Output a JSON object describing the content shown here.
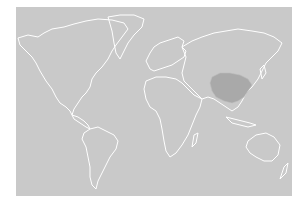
{
  "map": {
    "type": "world-outline",
    "background_color": "#c9c9c9",
    "outline_color": "#ffffff",
    "highlighted_region": {
      "name": "China",
      "color": "#a9a9a9"
    }
  }
}
